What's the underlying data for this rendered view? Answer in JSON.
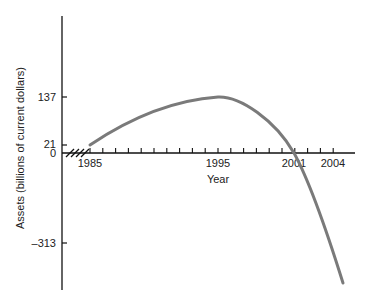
{
  "chart_data": {
    "type": "line",
    "title": "",
    "xlabel": "Year",
    "ylabel": "Assets (billions of current dollars)",
    "x_tick_labels": [
      "1985",
      "1995",
      "2001",
      "2004"
    ],
    "y_tick_labels": [
      "137",
      "21",
      "0",
      "–313"
    ],
    "y_ticks": [
      137,
      21,
      0,
      -313
    ],
    "x_ticks": [
      1985,
      1995,
      2001,
      2004
    ],
    "xlim": [
      1983,
      2006
    ],
    "ylim": [
      -450,
      500
    ],
    "grid": false,
    "legend": null,
    "axis_break": "x-axis break marks between origin and 1985",
    "series": [
      {
        "name": "Assets",
        "color": "#7a7a7a",
        "x": [
          1985,
          1987,
          1989,
          1991,
          1993,
          1995,
          1996,
          1997,
          1998,
          1999,
          2000,
          2001,
          2002,
          2003,
          2004,
          2005
        ],
        "values": [
          21,
          50,
          78,
          103,
          125,
          137,
          133,
          120,
          99,
          70,
          38,
          0,
          -60,
          -140,
          -240,
          -385
        ]
      }
    ]
  },
  "colors": {
    "axis": "#111111",
    "curve": "#7a7a7a"
  }
}
